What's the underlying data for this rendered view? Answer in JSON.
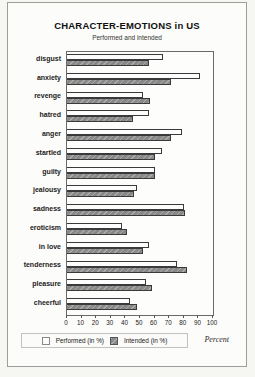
{
  "chart_data": {
    "type": "bar",
    "orientation": "horizontal",
    "title": "CHARACTER-EMOTIONS in US",
    "subtitle": "Performed and intended",
    "xlabel": "Percent",
    "xlim": [
      0,
      100
    ],
    "xticks": [
      0,
      10,
      20,
      30,
      40,
      50,
      60,
      70,
      80,
      90,
      100
    ],
    "grid": false,
    "legend_position": "bottom",
    "categories": [
      "disgust",
      "anxiety",
      "revenge",
      "hatred",
      "anger",
      "startled",
      "guilty",
      "jealousy",
      "sadness",
      "eroticism",
      "in love",
      "tenderness",
      "pleasure",
      "cheerful"
    ],
    "series": [
      {
        "name": "Performed",
        "values": [
          66,
          91,
          52,
          56,
          79,
          65,
          60,
          48,
          80,
          38,
          56,
          75,
          54,
          43
        ]
      },
      {
        "name": "Intended",
        "values": [
          56,
          71,
          57,
          45,
          71,
          60,
          60,
          46,
          81,
          41,
          52,
          82,
          58,
          48
        ]
      }
    ],
    "legend": {
      "performed_label": "Performed (in %)",
      "intended_label": "Intended (in %)"
    },
    "colors": {
      "performed": "#fdfdfd",
      "intended": "#8b8b8b",
      "bar_border": "#3a3a3a"
    }
  }
}
